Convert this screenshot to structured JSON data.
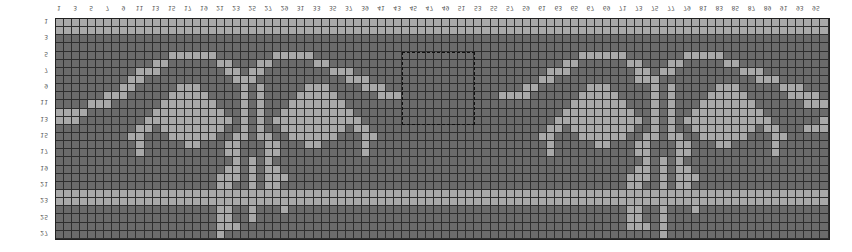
{
  "chart": {
    "title": "",
    "columns": 96,
    "rows": 27,
    "column_labels": [
      "1",
      "3",
      "5",
      "7",
      "9",
      "11",
      "13",
      "15",
      "17",
      "19",
      "21",
      "23",
      "25",
      "27",
      "29",
      "31",
      "33",
      "35",
      "37",
      "39",
      "41",
      "43",
      "45",
      "47",
      "49",
      "51",
      "53",
      "55",
      "57",
      "59",
      "61",
      "63",
      "65",
      "67",
      "69",
      "71",
      "73",
      "75",
      "77",
      "79",
      "81",
      "83",
      "85",
      "87",
      "89",
      "91",
      "93",
      "95"
    ],
    "row_labels": [
      "1",
      "3",
      "5",
      "7",
      "9",
      "11",
      "13",
      "15",
      "17",
      "19",
      "21",
      "23",
      "25",
      "27"
    ],
    "colors": {
      "light": "#a9a9a9",
      "dark": "#6b6b6b",
      "gridline": "#2e2e2e"
    },
    "selection": {
      "col_start": 44,
      "col_end": 52,
      "row_start": 5,
      "row_end": 13
    },
    "pattern_rows": [
      "111111111111111111111111111111111111111111111111111111111111111111111111111111111111111111111111",
      "111111111111111111111111111111111111111111111111111111111111111111111111111111111111111111111111",
      "000000000000000000000000000000000000000000000000000000000000000000000000000000000000000000000000",
      "000000000000000000000000000000000000000000000000000000000000000000000000000000000000000000000000",
      "000000000000001111110000000111110000000000000000000000000000000001111110000000111110000000000000",
      "000000000000110000001100011000001100000000000000000000000000000110000001100011000001100000000000",
      "000000000011100000000110110000000011100000000000000000000000011100000000110110000000011100000000",
      "000000000110000000000011100000000000111000000000000000000000110000000000111000000000000111000000",
      "000000001100000111000001010000011100001110000000000000000011000000111000001010000011100000111000",
      "000000111000001111100001010000111110000011100000000000011110000001111100001010000111110000011110",
      "000011100000011111110001010001111111000000000000000000000000000011111110001010001111111000000111",
      "111100000000111111111001010011111111100000000000000000000000000111111111001010011111111100000000",
      "111000000001111111111101010111111111110000000000000000000000001111111111101010111111111110000001",
      "000000000011011111111001010011111111011000000000000000000000011011111111001010011111111011000111",
      "000000000110001111110011011001111110001100000000000000000000110001111110011011001111110001100000",
      "000000000010000011000110001100011000001000000000000000000000010000011000110001100011000001000000",
      "000000000010000000000110001100000000001000000000000000000000010000000000110001100000000001000000",
      "000000000000000000000010101000000000000000000000000000000000000000000000010101000000000000000000",
      "000000000000000000000110101100000000000000000000000000000000000000000000110101100000000000000000",
      "000000000000000000001110101110000000000000000000000000000000000000000001110101110000000000000000",
      "000000000000000000001100101100000000000000000000000000000000000000000001100101100000000000000000",
      "111111111111111111111111111111111111111111111111111111111111111111111111111111111111111111111111",
      "111111111111111111111111111111111111111111111111111111111111111111111111111111111111111111111111",
      "000000000000000000001100100010000000000000000000000000000000000000000001100100010000000000000000",
      "000000000000000000001100100000000000000000000000000000000000000000000001100100000000000000000000",
      "000000000000000000001110000000000000000000000000000000000000000000000001110100000000000000000000",
      "000000000000000000001000000000000000000000000000000000000000000000000000000100000000000000000000"
    ]
  }
}
